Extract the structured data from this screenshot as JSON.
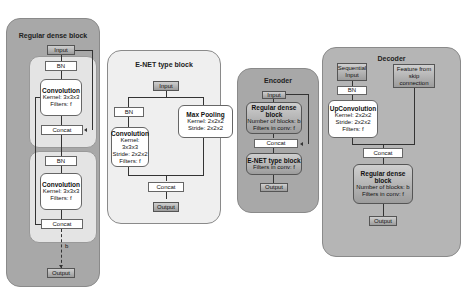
{
  "panels": {
    "regular_dense": {
      "title": "Regular dense block",
      "input": "Input",
      "layer1": {
        "bn": "BN",
        "conv_title": "Convolution",
        "kernel": "Kernel: 3x3x3",
        "filters": "Filters: f",
        "concat": "Concat"
      },
      "layer2": {
        "bn": "BN",
        "conv_title": "Convolution",
        "kernel": "Kernel: 3x3x3",
        "filters": "Filters: f",
        "concat": "Concat"
      },
      "repeat_label": "b",
      "output": "Output"
    },
    "enet": {
      "title": "E-NET type block",
      "input": "Input",
      "bn": "BN",
      "conv_title": "Convolution",
      "conv_kernel": "Kernel: 3x3x3",
      "conv_stride": "Stride: 2x2x2",
      "conv_filters": "Filters: f",
      "pool_title": "Max Pooling",
      "pool_kernel": "Kernel: 2x2x2",
      "pool_stride": "Stride: 2x2x2",
      "concat": "Concat",
      "output": "Output"
    },
    "encoder": {
      "title": "Encoder",
      "input": "Input",
      "dense_title": "Regular dense block",
      "dense_blocks": "Number of blocks: b",
      "dense_filters": "Filters in conv: f",
      "concat": "Concat",
      "enet_title": "E-NET type block",
      "enet_filters": "Filters in conv: f",
      "output": "Output"
    },
    "decoder": {
      "title": "Decoder",
      "seq_input": "Sequential Input",
      "skip": "Feature from skip connection",
      "bn": "BN",
      "upconv_title": "UpConvolution",
      "upconv_kernel": "Kernel: 2x2x2",
      "upconv_stride": "Stride: 2x2x2",
      "upconv_filters": "Filters: f",
      "concat": "Concat",
      "dense_title": "Regular dense block",
      "dense_blocks": "Number of blocks: b",
      "dense_filters": "Filters in conv: f",
      "output": "Output"
    }
  },
  "colors": {
    "dark_panel": "#a8a8a8",
    "light_panel": "#efefef",
    "grey_box": "#b0b0b0",
    "white_box": "#ffffff"
  }
}
